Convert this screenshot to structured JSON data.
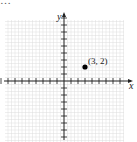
{
  "header": {
    "cropped_text": "…"
  },
  "chart_data": {
    "type": "scatter",
    "title": "",
    "xlabel": "x",
    "ylabel": "y",
    "xlim": [
      -9,
      8
    ],
    "ylim": [
      -8,
      9
    ],
    "grid": true,
    "tick_spacing": 1,
    "points": [
      {
        "x": 3,
        "y": 2,
        "label": "(3, 2)"
      }
    ],
    "colors": {
      "grid": "#dcdcdc",
      "axis": "#222222",
      "point": "#000000"
    }
  }
}
